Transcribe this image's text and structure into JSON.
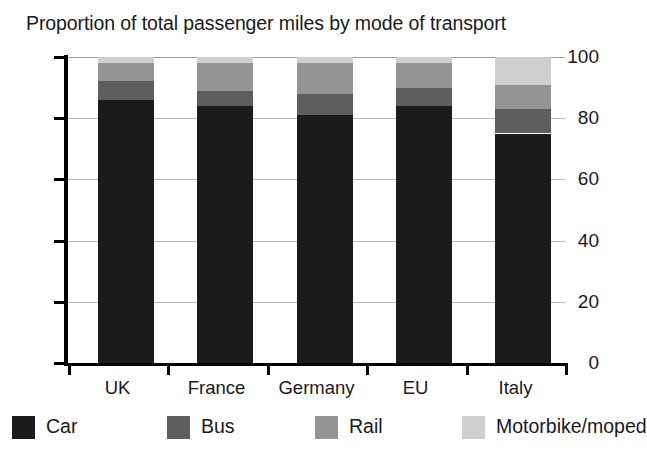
{
  "chart_data": {
    "type": "bar",
    "subtype": "stacked-bar-100",
    "title": "Proportion of total passenger miles by mode of transport",
    "xlabel": "",
    "ylabel": "",
    "ylim": [
      0,
      100
    ],
    "yticks": [
      0,
      20,
      40,
      60,
      80,
      100
    ],
    "ytick_labels": [
      "0",
      "20",
      "40",
      "60",
      "80",
      "100"
    ],
    "grid": true,
    "legend_position": "bottom",
    "categories": [
      "UK",
      "France",
      "Germany",
      "EU",
      "Italy"
    ],
    "series": [
      {
        "name": "Car",
        "color": "#1b1b1b",
        "values": [
          86,
          84,
          81,
          84,
          75
        ]
      },
      {
        "name": "Bus",
        "color": "#5e5e5e",
        "values": [
          6,
          5,
          7,
          6,
          8
        ]
      },
      {
        "name": "Rail",
        "color": "#949494",
        "values": [
          6,
          9,
          10,
          8,
          8
        ]
      },
      {
        "name": "Motorbike/moped",
        "color": "#cfcfcf",
        "values": [
          2,
          2,
          2,
          2,
          9
        ]
      }
    ]
  },
  "legend": {
    "items": [
      {
        "label": "Car",
        "color": "#1b1b1b"
      },
      {
        "label": "Bus",
        "color": "#5e5e5e"
      },
      {
        "label": "Rail",
        "color": "#949494"
      },
      {
        "label": "Motorbike/moped",
        "color": "#cfcfcf"
      }
    ]
  }
}
